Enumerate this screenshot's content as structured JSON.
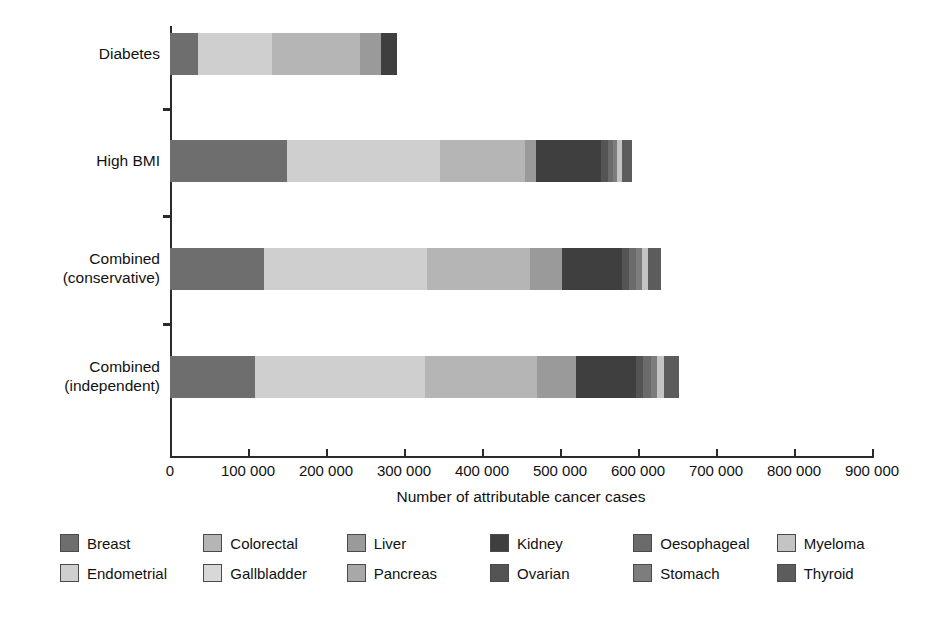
{
  "chart_data": {
    "type": "bar",
    "orientation": "horizontal",
    "stacked": true,
    "title": "",
    "xlabel": "Number of attributable cancer cases",
    "ylabel": "",
    "xlim": [
      0,
      900000
    ],
    "grid": false,
    "legend_position": "bottom",
    "xticks": [
      0,
      100000,
      200000,
      300000,
      400000,
      500000,
      600000,
      700000,
      800000,
      900000
    ],
    "xtick_labels": [
      "0",
      "100 000",
      "200 000",
      "300 000",
      "400 000",
      "500 000",
      "600 000",
      "700 000",
      "800 000",
      "900 000"
    ],
    "categories": [
      "Diabetes",
      "High BMI",
      "Combined (conservative)",
      "Combined (independent)"
    ],
    "category_labels": [
      [
        "Diabetes"
      ],
      [
        "High BMI"
      ],
      [
        "Combined",
        "(conservative)"
      ],
      [
        "Combined",
        "(independent)"
      ]
    ],
    "series": [
      {
        "name": "Breast",
        "color": "#6e6e6e",
        "values": [
          36000,
          150000,
          120000,
          109000
        ]
      },
      {
        "name": "Endometrial",
        "color": "#cfcfcf",
        "values": [
          95000,
          196000,
          210000,
          218000
        ]
      },
      {
        "name": "Colorectal",
        "color": "#b5b5b5",
        "values": [
          112000,
          109000,
          131000,
          144000
        ]
      },
      {
        "name": "Gallbladder",
        "color": "#d8d8d8",
        "values": [
          0,
          0,
          0,
          0
        ]
      },
      {
        "name": "Liver",
        "color": "#9a9a9a",
        "values": [
          27000,
          14000,
          41000,
          49000
        ]
      },
      {
        "name": "Pancreas",
        "color": "#a8a8a8",
        "values": [
          0,
          0,
          0,
          0
        ]
      },
      {
        "name": "Kidney",
        "color": "#3f3f3f",
        "values": [
          21000,
          83000,
          77000,
          77000
        ]
      },
      {
        "name": "Ovarian",
        "color": "#545454",
        "values": [
          0,
          9000,
          9000,
          9000
        ]
      },
      {
        "name": "Oesophageal",
        "color": "#6b6b6b",
        "values": [
          0,
          7000,
          10000,
          11000
        ]
      },
      {
        "name": "Stomach",
        "color": "#7d7d7d",
        "values": [
          0,
          5000,
          7000,
          8000
        ]
      },
      {
        "name": "Myeloma",
        "color": "#c4c4c4",
        "values": [
          0,
          6000,
          8000,
          9000
        ]
      },
      {
        "name": "Thyroid",
        "color": "#5c5c5c",
        "values": [
          0,
          13000,
          16000,
          18000
        ]
      }
    ],
    "totals": [
      291000,
      592000,
      629000,
      652000
    ],
    "legend_order": [
      "Breast",
      "Colorectal",
      "Liver",
      "Kidney",
      "Oesophageal",
      "Myeloma",
      "Endometrial",
      "Gallbladder",
      "Pancreas",
      "Ovarian",
      "Stomach",
      "Thyroid"
    ]
  }
}
